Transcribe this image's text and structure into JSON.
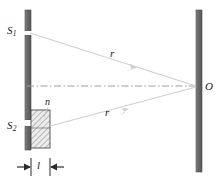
{
  "figure": {
    "labels": {
      "slit_top": "S",
      "slit_top_sub": "1",
      "slit_bottom": "S",
      "slit_bottom_sub": "2",
      "refractive_index": "n",
      "ray_upper": "r",
      "ray_lower": "r",
      "observation_point": "O",
      "plate_thickness": "l"
    },
    "colors": {
      "barrier": "#6b6b6b",
      "barrier_edge": "#4a4a4a",
      "screen": "#6b6b6b",
      "ray": "#c9c9c9",
      "axis": "#9a9a9a",
      "plate_fill": "#e8e8e8",
      "plate_hatch": "#8a8a8a",
      "plate_edge": "#4a4a4a",
      "dimension": "#2b2b2b",
      "text": "#1a1a1a",
      "background": "#ffffff"
    },
    "geometry": {
      "barrier_x": 25,
      "barrier_width": 6,
      "barrier_top": 10,
      "barrier_bottom": 150,
      "slit_top_y": 32,
      "slit_bottom_y": 123,
      "screen_x": 196,
      "screen_width": 6,
      "screen_top": 10,
      "screen_bottom": 172,
      "axis_y": 86,
      "point_o_x": 196,
      "point_o_y": 87,
      "plate_x": 31,
      "plate_y": 110,
      "plate_width": 19,
      "plate_height": 38,
      "dimension_y": 167,
      "dimension_left": 18,
      "dimension_right": 62,
      "tick_left_x": 31,
      "tick_right_x": 50
    }
  }
}
